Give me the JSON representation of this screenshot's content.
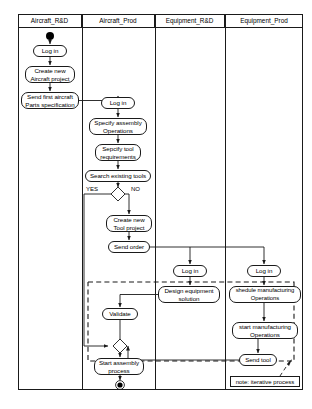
{
  "diagram": {
    "type": "uml-activity-diagram",
    "title": "",
    "swimlanes": [
      {
        "id": "aircraft-rd",
        "label": "Aircraft_R&D",
        "x": 0,
        "width": 64
      },
      {
        "id": "aircraft-prod",
        "label": "Aircraft_Prod",
        "x": 64,
        "width": 73
      },
      {
        "id": "equipment-rd",
        "label": "Equipment_R&D",
        "x": 137,
        "width": 70
      },
      {
        "id": "equipment-prod",
        "label": "Equipment_Prod",
        "x": 207,
        "width": 78
      }
    ],
    "nodes": [
      {
        "id": "start",
        "kind": "initial-node",
        "lane": "aircraft-rd",
        "label": ""
      },
      {
        "id": "login-rd",
        "kind": "action",
        "lane": "aircraft-rd",
        "label": "Log in",
        "x": 15,
        "y": 31,
        "w": 34,
        "h": 12
      },
      {
        "id": "create-aircraft-project",
        "kind": "action",
        "lane": "aircraft-rd",
        "label": "Create new\nAircraft project",
        "x": 7,
        "y": 52,
        "w": 50,
        "h": 17
      },
      {
        "id": "send-parts-spec",
        "kind": "action",
        "lane": "aircraft-rd",
        "label": "Send first aircraft\nParts specification",
        "x": 3,
        "y": 78,
        "w": 58,
        "h": 17
      },
      {
        "id": "login-prod",
        "kind": "action",
        "lane": "aircraft-prod",
        "label": "Log in",
        "x": 83,
        "y": 83,
        "w": 34,
        "h": 12
      },
      {
        "id": "specify-assembly",
        "kind": "action",
        "lane": "aircraft-prod",
        "label": "Specify assembly\nOperations",
        "x": 71,
        "y": 104,
        "w": 58,
        "h": 17
      },
      {
        "id": "specify-tool-req",
        "kind": "action",
        "lane": "aircraft-prod",
        "label": "Sepcify tool\nrequirements",
        "x": 77,
        "y": 130,
        "w": 46,
        "h": 17
      },
      {
        "id": "search-existing-tools",
        "kind": "action",
        "lane": "aircraft-prod",
        "label": "Search existing tools",
        "x": 67,
        "y": 156,
        "w": 66,
        "h": 12
      },
      {
        "id": "decision-tools",
        "kind": "decision",
        "lane": "aircraft-prod",
        "label": ""
      },
      {
        "id": "create-tool-project",
        "kind": "action",
        "lane": "aircraft-prod",
        "label": "Create new\nTool project",
        "x": 88,
        "y": 201,
        "w": 46,
        "h": 17
      },
      {
        "id": "send-order",
        "kind": "action",
        "lane": "aircraft-prod",
        "label": "Send order",
        "x": 90,
        "y": 227,
        "w": 42,
        "h": 12
      },
      {
        "id": "login-eqrd",
        "kind": "action",
        "lane": "equipment-rd",
        "label": "Log in",
        "x": 155,
        "y": 251,
        "w": 34,
        "h": 12
      },
      {
        "id": "design-equipment",
        "kind": "action",
        "lane": "equipment-rd",
        "label": "Design equipment\nsolution",
        "x": 140,
        "y": 272,
        "w": 62,
        "h": 17
      },
      {
        "id": "login-eqprod",
        "kind": "action",
        "lane": "equipment-prod",
        "label": "Log in",
        "x": 229,
        "y": 251,
        "w": 34,
        "h": 12
      },
      {
        "id": "schedule-manufacturing",
        "kind": "action",
        "lane": "equipment-prod",
        "label": "shedule manufacturing\nOperations",
        "x": 211,
        "y": 272,
        "w": 72,
        "h": 17
      },
      {
        "id": "start-manufacturing",
        "kind": "action",
        "lane": "equipment-prod",
        "label": "start manufacturing\nOperations",
        "x": 214,
        "y": 308,
        "w": 66,
        "h": 17
      },
      {
        "id": "send-tool",
        "kind": "action",
        "lane": "equipment-prod",
        "label": "Send tool",
        "x": 221,
        "y": 340,
        "w": 38,
        "h": 12
      },
      {
        "id": "validate",
        "kind": "action",
        "lane": "aircraft-prod",
        "label": "Validate",
        "x": 84,
        "y": 294,
        "w": 36,
        "h": 12
      },
      {
        "id": "merge",
        "kind": "merge",
        "lane": "aircraft-prod",
        "label": ""
      },
      {
        "id": "start-assembly",
        "kind": "action",
        "lane": "aircraft-prod",
        "label": "Start assembly\nprocess",
        "x": 76,
        "y": 344,
        "w": 50,
        "h": 17
      },
      {
        "id": "end",
        "kind": "final-node",
        "lane": "aircraft-prod",
        "label": ""
      }
    ],
    "edge_labels": [
      {
        "id": "yes-label",
        "text": "YES",
        "x": 68,
        "y": 175
      },
      {
        "id": "no-label",
        "text": "NO",
        "x": 113,
        "y": 175
      }
    ],
    "note": {
      "id": "iterative-note",
      "text": "note: iterative process"
    },
    "colors": {
      "stroke": "#1a1a1a",
      "fill": "#ffffff",
      "text": "#000000"
    }
  }
}
